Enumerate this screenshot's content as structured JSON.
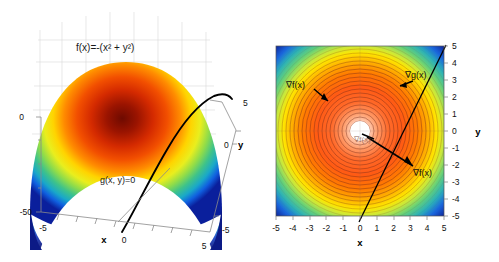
{
  "figure": {
    "title": "",
    "panels": [
      "surface-plot",
      "contour-plot"
    ]
  },
  "chart_data": [
    {
      "type": "area",
      "id": "left-surface",
      "render": "3d-surface",
      "title": "f(x)=-(x² + y²)",
      "function_label": "f(x)=-(x² + y²)",
      "constraint_label": "g(x, y)=0",
      "xlabel": "x",
      "ylabel": "y",
      "zlabel": "",
      "xlim": [
        -5,
        5
      ],
      "ylim": [
        -5,
        5
      ],
      "zlim": [
        -50,
        0
      ],
      "xticks": [
        "-5",
        "0",
        "5"
      ],
      "yticks": [
        "5",
        "0",
        "-5"
      ],
      "zticks": [
        "0",
        "-50"
      ],
      "colormap": "jet",
      "grid": true,
      "legend": "none",
      "annotations": [
        {
          "text": "f(x)=-(x² + y²)",
          "x": -2.2,
          "y": 4.2
        },
        {
          "text": "g(x, y)=0",
          "x": -0.6,
          "y": -1.2
        }
      ]
    },
    {
      "type": "heatmap",
      "id": "right-contour",
      "render": "contour-filled",
      "title": "",
      "xlabel": "x",
      "ylabel": "y",
      "xlim": [
        -5,
        5
      ],
      "ylim": [
        -5,
        5
      ],
      "xticks": [
        "-5",
        "-4",
        "-3",
        "-2",
        "-1",
        "0",
        "1",
        "2",
        "3",
        "4",
        "5"
      ],
      "yticks": [
        "5",
        "4",
        "3",
        "2",
        "1",
        "0",
        "-1",
        "-2",
        "-3",
        "-4",
        "-5"
      ],
      "colormap": "jet",
      "grid": false,
      "legend": "none",
      "contour_levels": 26,
      "constraint_line": {
        "label": "g(x,y)=0",
        "slope": 1.55,
        "intercept": -0.1
      },
      "annotations": [
        {
          "text": "∇f(x)",
          "x": -2.1,
          "y": 2.35,
          "name": "grad-f-upper"
        },
        {
          "text": "∇g(x)",
          "x": 2.55,
          "y": 2.85,
          "name": "grad-g"
        },
        {
          "text": "∇f(x)",
          "x": 0.25,
          "y": -0.25,
          "name": "grad-f-center"
        },
        {
          "text": "∇f(x)",
          "x": 3.1,
          "y": -2.0,
          "name": "grad-f-lower"
        }
      ]
    }
  ],
  "left_panel": {
    "equation": "f(x)=-(x² + y²)",
    "constraint": "g(x, y)=0",
    "axis_x_label": "x",
    "axis_y_label": "y",
    "z_tick_top": "0",
    "z_tick_bottom": "-50",
    "x_tick_min": "-5",
    "x_tick_mid": "0",
    "x_tick_max": "5",
    "y_tick_max": "5",
    "y_tick_mid": "0",
    "y_tick_min": "-5"
  },
  "right_panel": {
    "axis_x_label": "x",
    "axis_y_label": "y",
    "x_ticks": [
      "-5",
      "-4",
      "-3",
      "-2",
      "-1",
      "0",
      "1",
      "2",
      "3",
      "4",
      "5"
    ],
    "y_ticks": [
      "5",
      "4",
      "3",
      "2",
      "1",
      "0",
      "-1",
      "-2",
      "-3",
      "-4",
      "-5"
    ],
    "grad_f_upper": "∇f(x)",
    "grad_g": "∇g(x)",
    "grad_f_center": "∇f(x)",
    "grad_f_lower": "∇f(x)"
  },
  "colors": {
    "jet_low": "#00007f",
    "jet_blue": "#0000ff",
    "jet_cyan": "#00ffff",
    "jet_green": "#7fff7f",
    "jet_yellow": "#ffff00",
    "jet_orange": "#ff7f00",
    "jet_red": "#ff0000",
    "jet_high": "#7f0000",
    "contour_line": "#7a2d18",
    "axis": "#8a8a8a",
    "text": "#1a1a1a",
    "background": "#ffffff"
  }
}
